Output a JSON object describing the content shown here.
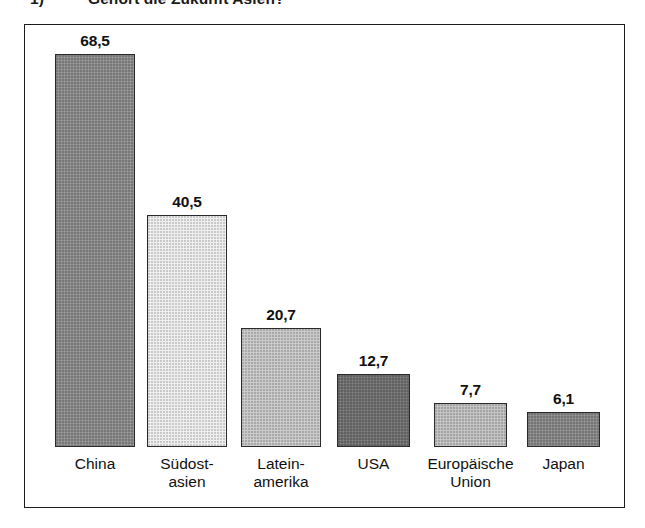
{
  "caption": {
    "number": "1)",
    "text": "Gehört die Zukunft Asien?"
  },
  "chart_data": {
    "type": "bar",
    "title": "",
    "subtitle": "",
    "xlabel": "",
    "ylabel": "",
    "ylim": [
      0,
      75
    ],
    "grid": false,
    "legend": "none",
    "axis_visible": false,
    "categories": [
      "China",
      "Südost-\nasien",
      "Latein-\namerika",
      "USA",
      "Europäische\nUnion",
      "Japan"
    ],
    "values": [
      68.5,
      40.5,
      20.7,
      12.7,
      7.7,
      6.1
    ],
    "value_labels": [
      "68,5",
      "40,5",
      "20,7",
      "12,7",
      "7,7",
      "6,1"
    ],
    "bar_colors": [
      "#8d8d8d",
      "#eeeeee",
      "#c9c9c9",
      "#727272",
      "#c2c2c2",
      "#8a8a8a"
    ],
    "bar_border_color": "#2a2a2a",
    "decimal_separator": ","
  },
  "frame": {
    "border_color": "#1c1c1c",
    "background": "#ffffff"
  }
}
